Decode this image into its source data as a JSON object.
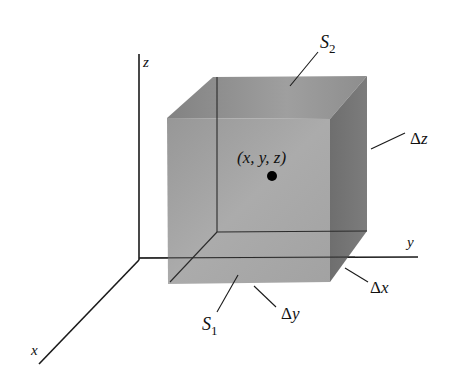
{
  "figure": {
    "type": "3d-box-volume-element",
    "axes": {
      "x_label": "x",
      "y_label": "y",
      "z_label": "z"
    },
    "point_label": "(x, y, z)",
    "surfaces": {
      "top": {
        "name": "S",
        "sub": "2"
      },
      "bottom": {
        "name": "S",
        "sub": "1"
      }
    },
    "dimensions": {
      "dx": {
        "delta": "Δ",
        "var": "x"
      },
      "dy": {
        "delta": "Δ",
        "var": "y"
      },
      "dz": {
        "delta": "Δ",
        "var": "z"
      }
    },
    "colors": {
      "front_face": "#9a9a9a",
      "top_face": "#8c8c8c",
      "side_face": "#6e6e6e",
      "lines": "#1a1a1a",
      "point": "#000000",
      "background": "#ffffff"
    }
  }
}
